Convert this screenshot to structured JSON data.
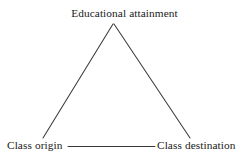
{
  "diagram": {
    "type": "triangle-relationship-diagram",
    "background_color": "#ffffff",
    "line_color": "#3a3a3a",
    "text_color": "#1a1a1a",
    "nodes": [
      {
        "id": "apex",
        "label": "Educational attainment"
      },
      {
        "id": "left",
        "label": "Class origin"
      },
      {
        "id": "right",
        "label": "Class destination"
      }
    ],
    "edges": [
      {
        "id": "origin-to-education",
        "from": "left",
        "to": "apex"
      },
      {
        "id": "education-to-destination",
        "from": "apex",
        "to": "right"
      },
      {
        "id": "origin-to-destination",
        "from": "left",
        "to": "right"
      }
    ]
  }
}
